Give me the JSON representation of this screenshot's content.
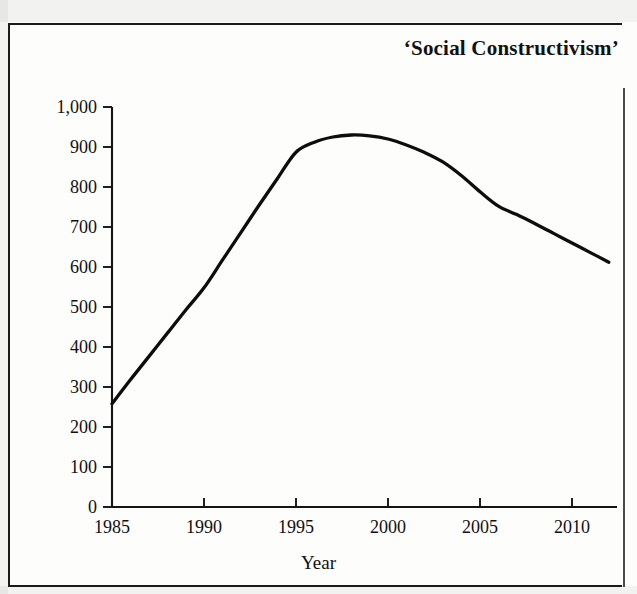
{
  "figure": {
    "title": "‘Social Constructivism’",
    "y_axis_title": "Number of Articles",
    "x_axis_title": "Year",
    "ink_color": "#0d0d0d",
    "paper_color": "#fdfdfc",
    "frame_color": "#1b1b1b"
  },
  "chart_data": {
    "type": "line",
    "title": "‘Social Constructivism’",
    "xlabel": "Year",
    "ylabel": "Number of Articles",
    "xlim": [
      1985,
      2012
    ],
    "ylim": [
      0,
      1000
    ],
    "grid": false,
    "legend": "none",
    "x_ticks": [
      1985,
      1990,
      1995,
      2000,
      2005,
      2010
    ],
    "x_tick_labels": [
      "1985",
      "1990",
      "1995",
      "2000",
      "2005",
      "2010"
    ],
    "y_ticks": [
      0,
      100,
      200,
      300,
      400,
      500,
      600,
      700,
      800,
      900,
      1000
    ],
    "y_tick_labels": [
      "0",
      "100",
      "200",
      "300",
      "400",
      "500",
      "600",
      "700",
      "800",
      "900",
      "1,000"
    ],
    "series": [
      {
        "name": "Number of Articles",
        "x": [
          1985,
          1986,
          1987,
          1988,
          1989,
          1990,
          1991,
          1992,
          1993,
          1994,
          1995,
          1996,
          1997,
          1998,
          1999,
          2000,
          2001,
          2002,
          2003,
          2004,
          2005,
          2006,
          2007,
          2008,
          2009,
          2010,
          2011,
          2012
        ],
        "values": [
          258,
          318,
          376,
          434,
          492,
          548,
          617,
          686,
          755,
          822,
          887,
          912,
          925,
          930,
          928,
          920,
          905,
          886,
          862,
          828,
          788,
          752,
          731,
          708,
          684,
          660,
          636,
          612
        ]
      }
    ],
    "annotations": {
      "peak_year": 1998,
      "peak_value": 930,
      "start_value": 258,
      "end_value": 612
    }
  }
}
